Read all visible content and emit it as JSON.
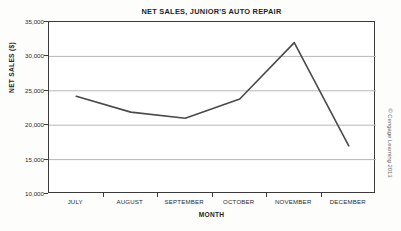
{
  "chart_data": {
    "type": "line",
    "title": "NET SALES, JUNIOR'S AUTO REPAIR",
    "xlabel": "MONTH",
    "ylabel": "NET SALES ($)",
    "categories": [
      "JULY",
      "AUGUST",
      "SEPTEMBER",
      "OCTOBER",
      "NOVEMBER",
      "DECEMBER"
    ],
    "values": [
      24200,
      21900,
      21000,
      23800,
      32000,
      17000
    ],
    "series": [
      {
        "name": "Net sales",
        "values": [
          24200,
          21900,
          21000,
          23800,
          32000,
          17000
        ]
      }
    ],
    "ylim": [
      10000,
      35000
    ],
    "y_ticks": [
      35000,
      30000,
      25000,
      20000,
      15000,
      10000
    ],
    "y_tick_labels": [
      "35,000",
      "30,000",
      "25,000",
      "20,000",
      "15,000",
      "10,000"
    ],
    "grid": true,
    "grid_axis": "y",
    "legend": false,
    "legend_position": "none",
    "line_color": "#4a4a4a",
    "grid_color": "#b8b8b8",
    "axis_color": "#3a3a3a",
    "background_color": "#ffffff"
  },
  "figure": {
    "credit": "© Cengage Learning 2013"
  }
}
